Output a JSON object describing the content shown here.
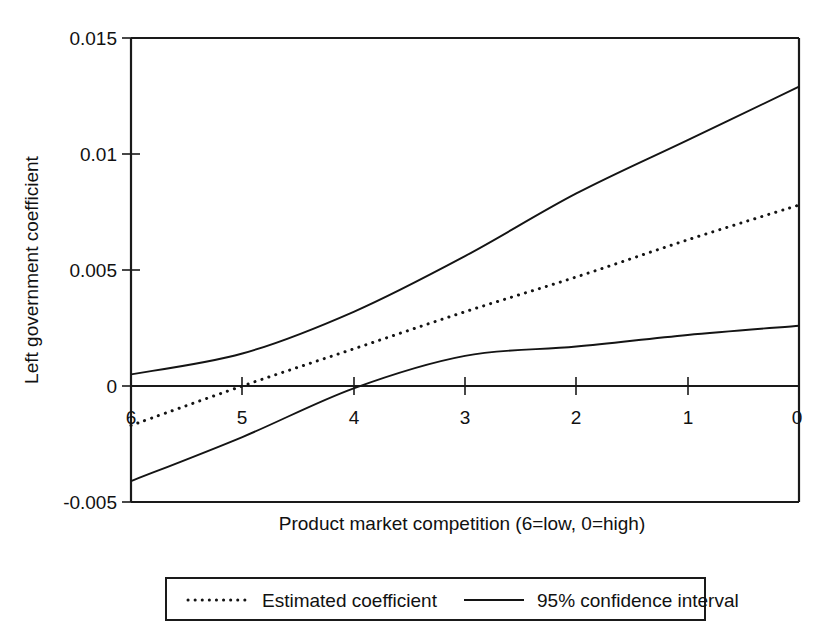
{
  "chart_data": {
    "type": "line",
    "title": "",
    "xlabel": "Product market competition (6=low, 0=high)",
    "ylabel": "Left government coefficient",
    "x": [
      6,
      5,
      4,
      3,
      2,
      1,
      0
    ],
    "xlim": [
      6,
      0
    ],
    "ylim": [
      -0.005,
      0.015
    ],
    "x_ticklabels": [
      "6",
      "5",
      "4",
      "3",
      "2",
      "1",
      "0"
    ],
    "y_ticklabels": [
      "0.015",
      "0.01",
      "0.005",
      "0",
      "-0.005"
    ],
    "y_tickvalues": [
      0.015,
      0.01,
      0.005,
      0,
      -0.005
    ],
    "grid": false,
    "legend_position": "below-plot",
    "zero_reference_line": 0,
    "series": [
      {
        "name": "Estimated coefficient",
        "style": "dotted",
        "values": [
          -0.0017,
          0.0,
          0.0016,
          0.0032,
          0.0047,
          0.0063,
          0.0078
        ]
      },
      {
        "name": "95% confidence interval",
        "style": "solid",
        "bound": "upper",
        "values": [
          0.0005,
          0.0014,
          0.0032,
          0.0056,
          0.0083,
          0.0106,
          0.0129
        ]
      },
      {
        "name": "95% confidence interval",
        "style": "solid",
        "bound": "lower",
        "values": [
          -0.0041,
          -0.0022,
          -0.0001,
          0.0013,
          0.0017,
          0.0022,
          0.0026
        ]
      }
    ]
  },
  "legend": {
    "entries": [
      {
        "label": "Estimated coefficient",
        "style": "dotted"
      },
      {
        "label": "95% confidence interval",
        "style": "solid"
      }
    ]
  },
  "colors": {
    "line": "#141414",
    "axis": "#1a1a1a",
    "background": "#ffffff"
  }
}
